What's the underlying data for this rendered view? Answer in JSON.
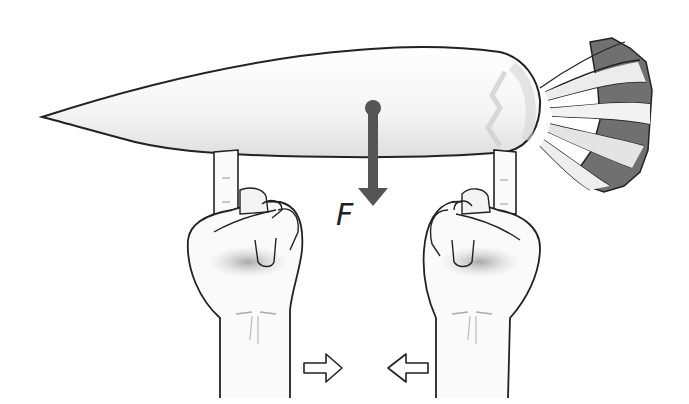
{
  "diagram": {
    "force": {
      "label": "F",
      "direction": "down",
      "color": "#555555"
    },
    "arrows": [
      {
        "name": "left-hand-motion",
        "direction": "right"
      },
      {
        "name": "right-hand-motion",
        "direction": "left"
      }
    ],
    "colors": {
      "outline": "#222222",
      "carrot_fill": "#f6f6f6",
      "carrot_shade": "#dcdcdc",
      "leaf_dark": "#6e6e6e",
      "leaf_light": "#e8e8e8",
      "skin_shade": "#bdbdbd",
      "force_arrow": "#555555"
    }
  }
}
